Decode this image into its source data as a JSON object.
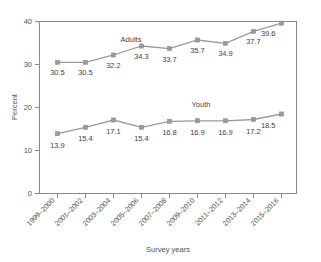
{
  "chart_data": {
    "type": "line",
    "title": "",
    "xlabel": "Survey years",
    "ylabel": "Percent",
    "ylim": [
      0,
      40
    ],
    "yticks": [
      "0",
      "10",
      "20",
      "30",
      "40"
    ],
    "grid": false,
    "legend": "inline-series-labels",
    "categories": [
      "1999–2000",
      "2001–2002",
      "2003–2004",
      "2005–2006",
      "2007–2008",
      "2009–2010",
      "2011–2012",
      "2013–2014",
      "2015–2016"
    ],
    "series": [
      {
        "name": "Adults",
        "color": "#9a9a9a",
        "values": [
          30.5,
          30.5,
          32.2,
          34.3,
          33.7,
          35.7,
          34.9,
          37.7,
          39.6
        ],
        "labels": [
          "30.5",
          "30.5",
          "32.2",
          "34.3",
          "33.7",
          "35.7",
          "34.9",
          "37.7",
          "39.6"
        ]
      },
      {
        "name": "Youth",
        "color": "#9a9a9a",
        "values": [
          13.9,
          15.4,
          17.1,
          15.4,
          16.8,
          16.9,
          16.9,
          17.2,
          18.5
        ],
        "labels": [
          "13.9",
          "15.4",
          "17.1",
          "15.4",
          "16.8",
          "16.9",
          "16.9",
          "17.2",
          "18.5"
        ]
      }
    ]
  },
  "colors": {
    "series": "#9a9a9a",
    "axis": "#8a8a8a",
    "text": "#4a4a4a",
    "background": "#ffffff"
  }
}
